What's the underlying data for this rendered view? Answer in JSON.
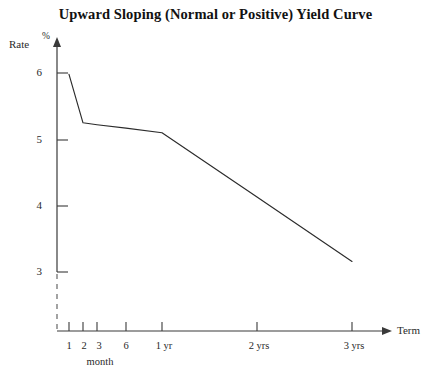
{
  "chart_data": {
    "type": "line",
    "title": "Upward Sloping (Normal or Positive) Yield Curve",
    "xlabel": "Term",
    "ylabel": "Rate",
    "y_unit": "%",
    "x_unit_note": "month",
    "grid": false,
    "legend": "none",
    "x_tick_labels": [
      "1",
      "2",
      "3",
      "6",
      "1 yr",
      "2 yrs",
      "3 yrs"
    ],
    "x_tick_positions_px": [
      69,
      83,
      97,
      126,
      162,
      257,
      352
    ],
    "x_tick_terms_months": [
      1,
      2,
      3,
      6,
      12,
      24,
      36
    ],
    "y_tick_labels": [
      "3",
      "4",
      "5",
      "6"
    ],
    "y_tick_values": [
      3,
      4,
      5,
      6
    ],
    "ylim": [
      2.65,
      6.4
    ],
    "axis_break_below": 3,
    "series": [
      {
        "name": "Yield Curve",
        "x_labels": [
          "1 month",
          "2 months",
          "3 months",
          "6 months",
          "1 yr",
          "2 yrs",
          "3 yrs"
        ],
        "x_months": [
          1,
          2,
          3,
          6,
          12,
          24,
          36
        ],
        "values": [
          3.02,
          3.75,
          3.78,
          3.83,
          3.9,
          4.87,
          5.84
        ]
      }
    ]
  },
  "axis": {
    "rate_label": "Rate",
    "percent_symbol": "%",
    "term_label": "Term",
    "month_label": "month"
  },
  "y_ticks": [
    {
      "label": "6",
      "y": 73
    },
    {
      "label": "5",
      "y": 140
    },
    {
      "label": "4",
      "y": 206
    },
    {
      "label": "3",
      "y": 272
    }
  ],
  "x_ticks": [
    {
      "label": "1",
      "x": 69
    },
    {
      "label": "2",
      "x": 83
    },
    {
      "label": "3",
      "x": 97
    },
    {
      "label": "6",
      "x": 126
    },
    {
      "label": "1 yr",
      "x": 162
    },
    {
      "label": "2 yrs",
      "x": 257
    },
    {
      "label": "3 yrs",
      "x": 352
    }
  ]
}
